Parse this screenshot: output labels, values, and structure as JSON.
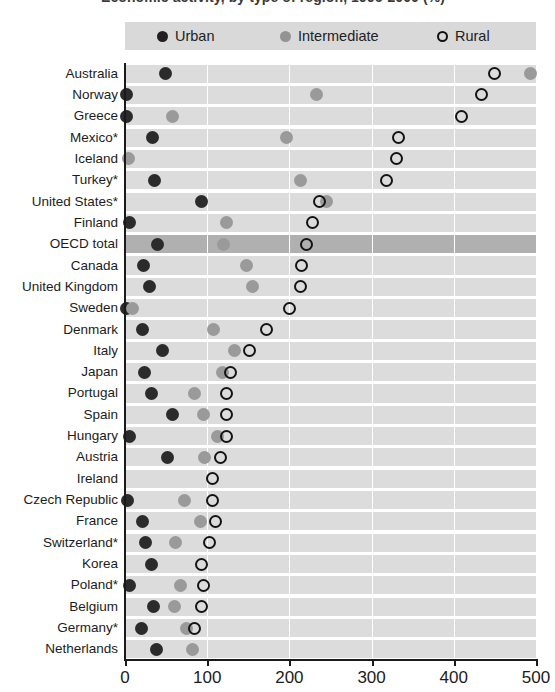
{
  "title": "Economic activity, by type of region, 1996-2000 (%)",
  "legend": {
    "position": "top",
    "items": [
      {
        "key": "urban",
        "label": "Urban",
        "color": "#231f20",
        "marker": "filled-dark-circle"
      },
      {
        "key": "intermediate",
        "label": "Intermediate",
        "color": "#939393",
        "marker": "filled-gray-circle"
      },
      {
        "key": "rural",
        "label": "Rural",
        "color": "#111111",
        "marker": "open-circle"
      }
    ]
  },
  "axis": {
    "x_ticks": [
      "0",
      "100",
      "200",
      "300",
      "400",
      "500"
    ],
    "x_min": 0,
    "x_max": 500
  },
  "highlight_row": "OECD total",
  "chart_data": {
    "type": "scatter",
    "title": "Economic activity, by type of region, 1996-2000 (%)",
    "xlabel": "",
    "ylabel": "",
    "xlim": [
      0,
      500
    ],
    "grid": true,
    "legend_position": "top",
    "categories": [
      "Australia",
      "Norway",
      "Greece",
      "Mexico*",
      "Iceland",
      "Turkey*",
      "United States*",
      "Finland",
      "OECD total",
      "Canada",
      "United Kingdom",
      "Sweden",
      "Denmark",
      "Italy",
      "Japan",
      "Portugal",
      "Spain",
      "Hungary",
      "Austria",
      "Ireland",
      "Czech Republic",
      "France",
      "Switzerland*",
      "Korea",
      "Poland*",
      "Belgium",
      "Germany*",
      "Netherlands"
    ],
    "series": [
      {
        "name": "Urban",
        "values": [
          49,
          2,
          2,
          33,
          null,
          36,
          93,
          5,
          40,
          22,
          30,
          2,
          21,
          46,
          24,
          32,
          58,
          6,
          52,
          null,
          3,
          21,
          25,
          32,
          5,
          35,
          20,
          38
        ]
      },
      {
        "name": "Intermediate",
        "values": [
          493,
          233,
          58,
          196,
          4,
          213,
          245,
          123,
          120,
          148,
          155,
          9,
          108,
          133,
          119,
          84,
          95,
          113,
          97,
          null,
          72,
          92,
          62,
          null,
          68,
          60,
          75,
          82
        ]
      },
      {
        "name": "Rural",
        "values": [
          450,
          434,
          409,
          333,
          330,
          318,
          237,
          228,
          221,
          215,
          213,
          200,
          172,
          152,
          128,
          124,
          124,
          124,
          116,
          106,
          106,
          110,
          103,
          93,
          96,
          93,
          85,
          null
        ]
      }
    ]
  }
}
